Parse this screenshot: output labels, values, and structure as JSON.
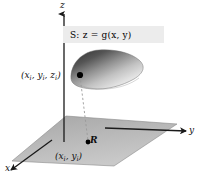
{
  "figure": {
    "type": "math-diagram",
    "background_color": "#ffffff",
    "axes": {
      "z_label": "z",
      "y_label": "y",
      "x_label": "x",
      "axis_color": "#1a1a1a"
    },
    "surface": {
      "label_text": "S:   z = g(x, y)",
      "label_box_color": "#ececec",
      "fill_dark": "#3a3a3a",
      "fill_light": "#f2f2f2"
    },
    "plane": {
      "region_label": "R",
      "fill_color": "#b4b4b4"
    },
    "points": {
      "surface_point_label": "(x",
      "surface_point_sub1": "i",
      "surface_point_mid": ", y",
      "surface_point_sub2": "i",
      "surface_point_mid2": ", z",
      "surface_point_sub3": "i",
      "surface_point_end": ")",
      "plane_point_label": "(x",
      "plane_point_sub1": "i",
      "plane_point_mid": ", y",
      "plane_point_sub2": "i",
      "plane_point_end": ")",
      "point_color": "#000000"
    },
    "connector": {
      "style": "dashed",
      "color": "#999999"
    }
  }
}
